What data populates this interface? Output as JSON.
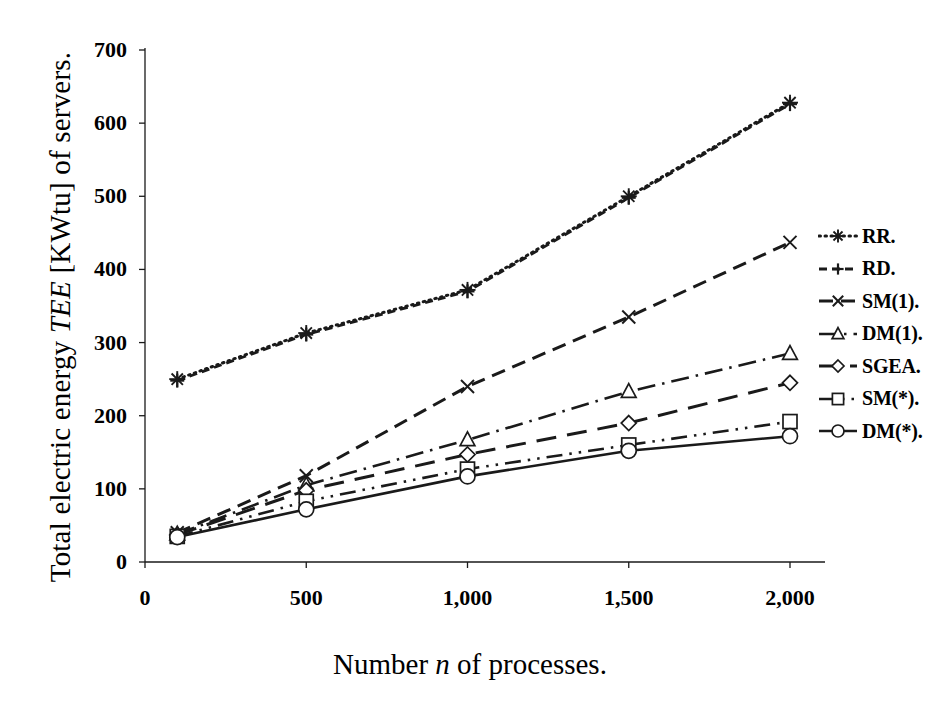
{
  "chart_data": {
    "type": "line",
    "title": "",
    "xlabel": "Number n of processes.",
    "ylabel": "Total electric energy TEE [KWtu] of servers.",
    "x": [
      100,
      500,
      1000,
      1500,
      2000
    ],
    "xlim": [
      0,
      2100
    ],
    "ylim": [
      0,
      700
    ],
    "grid": false,
    "legend_position": "right",
    "xticks": [
      "0",
      "500",
      "1,000",
      "1,500",
      "2,000"
    ],
    "xtick_values": [
      0,
      500,
      1000,
      1500,
      2000
    ],
    "yticks": [
      "0",
      "100",
      "200",
      "300",
      "400",
      "500",
      "600",
      "700"
    ],
    "ytick_values": [
      0,
      100,
      200,
      300,
      400,
      500,
      600,
      700
    ],
    "series": [
      {
        "name": "RR.",
        "marker": "asterisk",
        "dash": "dotted",
        "values": [
          250,
          313,
          372,
          500,
          628
        ]
      },
      {
        "name": "RD.",
        "marker": "plus",
        "dash": "dashed-short",
        "values": [
          248,
          311,
          370,
          498,
          626
        ]
      },
      {
        "name": "SM(1).",
        "marker": "cross",
        "dash": "dashed-long",
        "values": [
          40,
          118,
          240,
          335,
          437
        ]
      },
      {
        "name": "DM(1).",
        "marker": "triangle",
        "dash": "dash-dot",
        "values": [
          38,
          105,
          167,
          233,
          285
        ]
      },
      {
        "name": "SGEA.",
        "marker": "diamond",
        "dash": "dashed-xlong",
        "values": [
          37,
          98,
          147,
          190,
          245
        ]
      },
      {
        "name": "SM(*).",
        "marker": "square",
        "dash": "dash-dot-dot",
        "values": [
          35,
          83,
          127,
          160,
          192
        ]
      },
      {
        "name": "DM(*).",
        "marker": "circle",
        "dash": "solid",
        "values": [
          34,
          72,
          117,
          152,
          172
        ]
      }
    ]
  },
  "axes": {
    "y_title_pre": "Total electric energy ",
    "y_title_italic": "TEE",
    "y_title_post": " [KWtu] of servers.",
    "x_title_pre": "Number ",
    "x_title_italic": "n",
    "x_title_post": " of processes."
  },
  "legend": {
    "items": [
      {
        "label": "RR."
      },
      {
        "label": "RD."
      },
      {
        "label": "SM(1)."
      },
      {
        "label": "DM(1)."
      },
      {
        "label": "SGEA."
      },
      {
        "label": "SM(*)."
      },
      {
        "label": "DM(*)."
      }
    ]
  },
  "colors": {
    "ink": "#1a1a1a",
    "background": "#ffffff"
  }
}
